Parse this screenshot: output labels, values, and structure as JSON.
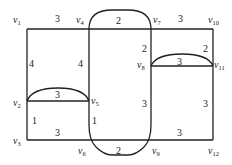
{
  "diagram": {
    "type": "weighted-graph",
    "vertices": [
      {
        "id": "v1",
        "name": "v",
        "sub": "1",
        "x": 6,
        "y": 11
      },
      {
        "id": "v2",
        "name": "v",
        "sub": "2",
        "x": 6,
        "y": 104
      },
      {
        "id": "v3",
        "name": "v",
        "sub": "3",
        "x": 6,
        "y": 143
      },
      {
        "id": "v4",
        "name": "v",
        "sub": "4",
        "x": 77,
        "y": 22
      },
      {
        "id": "v5",
        "name": "v",
        "sub": "5",
        "x": 91,
        "y": 104
      },
      {
        "id": "v6",
        "name": "v",
        "sub": "6",
        "x": 78,
        "y": 155
      },
      {
        "id": "v7",
        "name": "v",
        "sub": "7",
        "x": 153,
        "y": 22
      },
      {
        "id": "v8",
        "name": "v",
        "sub": "8",
        "x": 137,
        "y": 69
      },
      {
        "id": "v9",
        "name": "v",
        "sub": "9",
        "x": 151,
        "y": 155
      },
      {
        "id": "v10",
        "name": "v",
        "sub": "10",
        "x": 207,
        "y": 22
      },
      {
        "id": "v11",
        "name": "v",
        "sub": "11",
        "x": 215,
        "y": 69
      },
      {
        "id": "v12",
        "name": "v",
        "sub": "12",
        "x": 209,
        "y": 155
      }
    ],
    "edges": [
      {
        "from": "v1",
        "to": "v4",
        "weight": "3",
        "lx": 55,
        "ly": 22
      },
      {
        "from": "v4",
        "to": "v7",
        "weight": "2",
        "lx": 118,
        "ly": 24,
        "curved": true
      },
      {
        "from": "v7",
        "to": "v10",
        "weight": "3",
        "lx": 180,
        "ly": 22
      },
      {
        "from": "v1",
        "to": "v2",
        "weight": "4",
        "lx": 30,
        "ly": 67
      },
      {
        "from": "v4",
        "to": "v5",
        "weight": "4",
        "lx": 79,
        "ly": 67
      },
      {
        "from": "v7",
        "to": "v8",
        "weight": "2",
        "lx": 143,
        "ly": 50
      },
      {
        "from": "v10",
        "to": "v11",
        "weight": "2",
        "lx": 204,
        "ly": 50
      },
      {
        "from": "v2",
        "to": "v5",
        "weight": "3",
        "lx": 56,
        "ly": 98,
        "curved": true
      },
      {
        "from": "v8",
        "to": "v11",
        "weight": "3",
        "lx": 178,
        "ly": 64,
        "curved": true
      },
      {
        "from": "v2",
        "to": "v3",
        "weight": "1",
        "lx": 32,
        "ly": 124
      },
      {
        "from": "v5",
        "to": "v6",
        "weight": "1",
        "lx": 92,
        "ly": 124
      },
      {
        "from": "v8",
        "to": "v9",
        "weight": "3",
        "lx": 143,
        "ly": 107
      },
      {
        "from": "v11",
        "to": "v12",
        "weight": "3",
        "lx": 204,
        "ly": 107
      },
      {
        "from": "v3",
        "to": "v6",
        "weight": "3",
        "lx": 56,
        "ly": 135
      },
      {
        "from": "v6",
        "to": "v9",
        "weight": "2",
        "lx": 118,
        "ly": 154,
        "curved": true
      },
      {
        "from": "v9",
        "to": "v12",
        "weight": "3",
        "lx": 178,
        "ly": 135
      }
    ]
  }
}
